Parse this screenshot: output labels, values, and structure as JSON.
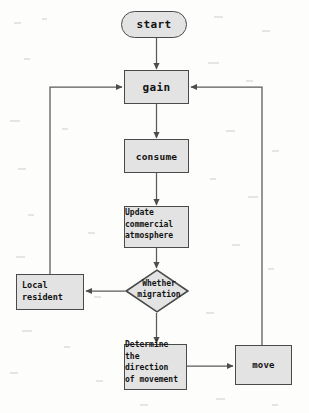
{
  "diagram": {
    "type": "flowchart",
    "canvas": {
      "width": 309,
      "height": 413
    },
    "colors": {
      "node_fill": "#e3e3e3",
      "node_border": "#4a4a4a",
      "edge": "#555555",
      "text": "#121212",
      "background": "#fdfdfc"
    },
    "nodes": [
      {
        "id": "start",
        "shape": "stadium",
        "label": "start"
      },
      {
        "id": "gain",
        "shape": "rect",
        "label": "gain"
      },
      {
        "id": "consume",
        "shape": "rect",
        "label": "consume"
      },
      {
        "id": "update",
        "shape": "rect",
        "label": "Update\ncommercial\natmosphere"
      },
      {
        "id": "decision",
        "shape": "diamond",
        "label": "Whether\nmigration"
      },
      {
        "id": "local",
        "shape": "rect",
        "label": "Local\nresident"
      },
      {
        "id": "determine",
        "shape": "rect",
        "label": "Determine\nthe\ndirection\nof movement"
      },
      {
        "id": "move",
        "shape": "rect",
        "label": "move"
      }
    ],
    "edges": [
      {
        "from": "start",
        "to": "gain",
        "label": ""
      },
      {
        "from": "gain",
        "to": "consume",
        "label": ""
      },
      {
        "from": "consume",
        "to": "update",
        "label": ""
      },
      {
        "from": "update",
        "to": "decision",
        "label": ""
      },
      {
        "from": "decision",
        "to": "local",
        "label": ""
      },
      {
        "from": "decision",
        "to": "determine",
        "label": ""
      },
      {
        "from": "determine",
        "to": "move",
        "label": ""
      },
      {
        "from": "local",
        "to": "gain",
        "label": ""
      },
      {
        "from": "move",
        "to": "gain",
        "label": ""
      }
    ]
  }
}
